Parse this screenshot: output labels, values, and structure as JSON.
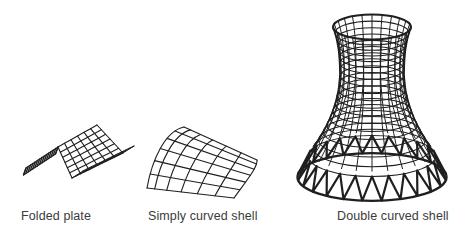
{
  "figure": {
    "background": "#ffffff",
    "line_color": "#1f1f1f",
    "label_color": "#3b3b3b",
    "items": [
      {
        "id": "folded-plate",
        "label": "Folded plate"
      },
      {
        "id": "simply-curved-shell",
        "label": "Simply curved shell"
      },
      {
        "id": "double-curved-shell",
        "label": "Double curved shell"
      }
    ]
  }
}
